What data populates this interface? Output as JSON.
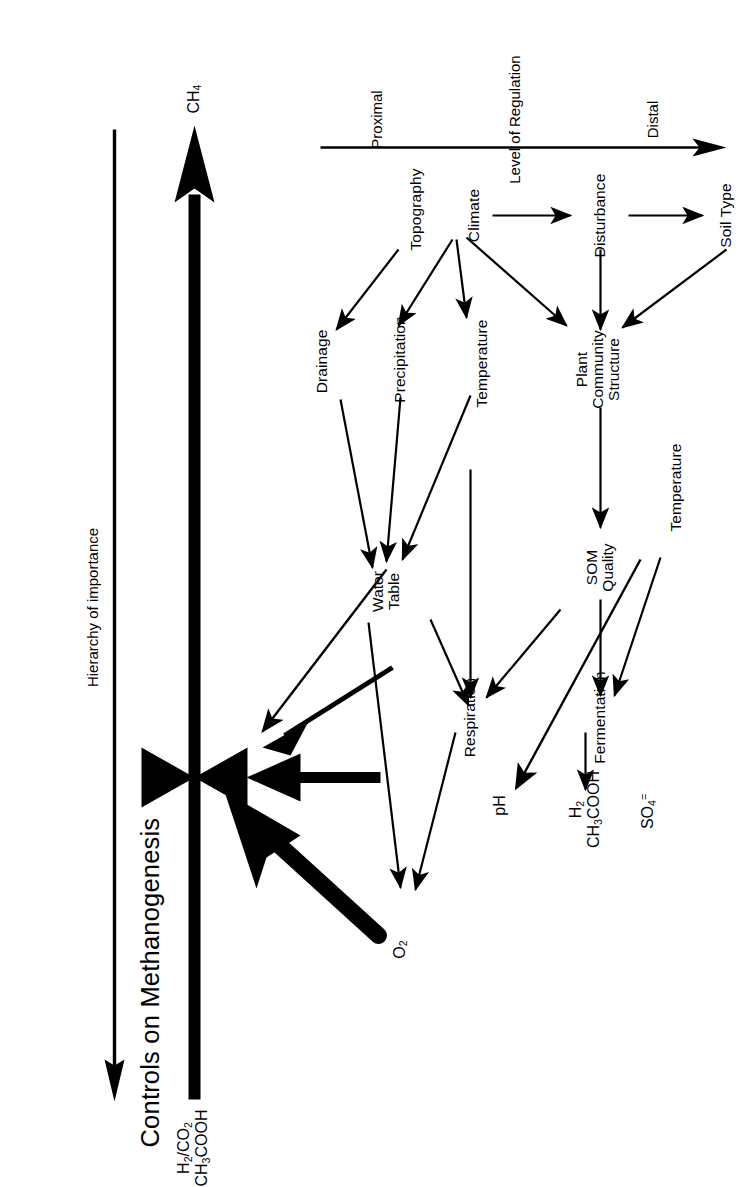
{
  "figure": {
    "title": "Controls on Methanogenesis",
    "type": "conceptual flow diagram",
    "orientation": "page rotated 90 degrees (landscape figure on portrait page)"
  },
  "top_flow": {
    "substrate_label_line1": "H2/CO2",
    "substrate_label_line2": "CH3COOH",
    "product_label": "CH4",
    "valve_name": "methanogenesis-valve",
    "hierarchy_arrow_label": "Hierarchy of importance",
    "hierarchy_arrow_direction": "right-to-left (toward substrates)",
    "main_arrow_direction": "left-to-right (substrates to CH4)"
  },
  "proximal_controls": [
    {
      "id": "o2",
      "label_html": "O2",
      "label_text": "O2",
      "weight": "very-thick"
    },
    {
      "id": "h2ac",
      "label_line1": "H2",
      "label_line2": "CH3COOH",
      "weight": "thick"
    },
    {
      "id": "ph",
      "label_html": "pH",
      "label_text": "pH",
      "weight": "medium"
    },
    {
      "id": "so4",
      "label_html": "SO4=",
      "label_text": "SO4=",
      "weight": "thin"
    }
  ],
  "nodes": [
    {
      "id": "topography",
      "label": "Topography"
    },
    {
      "id": "climate",
      "label": "Climate"
    },
    {
      "id": "disturbance",
      "label": "Disturbance"
    },
    {
      "id": "soil_type",
      "label": "Soil Type"
    },
    {
      "id": "drainage",
      "label": "Drainage"
    },
    {
      "id": "precipitation",
      "label": "Precipitation"
    },
    {
      "id": "temperature_left",
      "label": "Temperature"
    },
    {
      "id": "plant_community",
      "label_line1": "Plant",
      "label_line2": "Community",
      "label_line3": "Structure"
    },
    {
      "id": "water_table",
      "label_line1": "Water",
      "label_line2": "Table"
    },
    {
      "id": "som_quality",
      "label_line1": "SOM",
      "label_line2": "Quality"
    },
    {
      "id": "temperature_right",
      "label": "Temperature"
    },
    {
      "id": "respiration",
      "label": "Respiration"
    },
    {
      "id": "fermentation",
      "label": "Fermentation"
    }
  ],
  "edges": [
    {
      "from": "topography",
      "to": "drainage"
    },
    {
      "from": "climate",
      "to": "precipitation"
    },
    {
      "from": "climate",
      "to": "temperature_left"
    },
    {
      "from": "climate",
      "to": "plant_community"
    },
    {
      "from": "climate",
      "to": "disturbance"
    },
    {
      "from": "disturbance",
      "to": "soil_type"
    },
    {
      "from": "disturbance",
      "to": "plant_community"
    },
    {
      "from": "soil_type",
      "to": "plant_community"
    },
    {
      "from": "drainage",
      "to": "water_table"
    },
    {
      "from": "precipitation",
      "to": "water_table"
    },
    {
      "from": "temperature_left",
      "to": "water_table"
    },
    {
      "from": "temperature_left",
      "to": "respiration"
    },
    {
      "from": "plant_community",
      "to": "som_quality"
    },
    {
      "from": "water_table",
      "to": "o2"
    },
    {
      "from": "water_table",
      "to": "respiration"
    },
    {
      "from": "som_quality",
      "to": "respiration"
    },
    {
      "from": "som_quality",
      "to": "fermentation"
    },
    {
      "from": "temperature_right",
      "to": "fermentation"
    },
    {
      "from": "temperature_right",
      "to": "ph"
    },
    {
      "from": "respiration",
      "to": "o2"
    },
    {
      "from": "fermentation",
      "to": "h2ac"
    },
    {
      "from": "o2",
      "to": "valve"
    },
    {
      "from": "h2ac",
      "to": "valve"
    },
    {
      "from": "ph",
      "to": "valve"
    },
    {
      "from": "so4",
      "to": "valve"
    }
  ],
  "axis": {
    "caption": "Level of Regulation",
    "left_end_label": "Distal",
    "right_end_label": "Proximal",
    "arrow_direction": "points toward Distal"
  },
  "colors": {
    "ink": "#000000",
    "paper": "#ffffff"
  }
}
